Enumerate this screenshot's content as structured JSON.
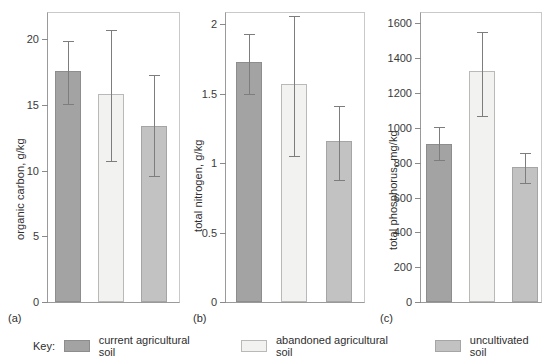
{
  "chart_data": [
    {
      "type": "bar",
      "panel": "(a)",
      "title": "",
      "xlabel": "",
      "ylabel": "organic carbon, g/kg",
      "ylim": [
        0,
        22
      ],
      "yticks": [
        0,
        5,
        10,
        15,
        20
      ],
      "ytick_labels": [
        "0",
        "5",
        "10",
        "15",
        "20"
      ],
      "grid": false,
      "categories": [
        "current agricultural soil",
        "abandoned agricultural soil",
        "uncultivated soil"
      ],
      "values": [
        17.6,
        15.8,
        13.4
      ],
      "err_upper": [
        19.9,
        20.7,
        17.3
      ],
      "err_lower": [
        15.1,
        10.7,
        9.6
      ]
    },
    {
      "type": "bar",
      "panel": "(b)",
      "title": "",
      "xlabel": "",
      "ylabel": "total nitrogen, g/kg",
      "ylim": [
        0,
        2.08
      ],
      "yticks": [
        0,
        0.5,
        1,
        1.5,
        2
      ],
      "ytick_labels": [
        "0",
        "0.5",
        "1",
        "1.5",
        "2"
      ],
      "grid": false,
      "categories": [
        "current agricultural soil",
        "abandoned agricultural soil",
        "uncultivated soil"
      ],
      "values": [
        1.73,
        1.57,
        1.16
      ],
      "err_upper": [
        1.93,
        2.06,
        1.41
      ],
      "err_lower": [
        1.5,
        1.05,
        0.88
      ]
    },
    {
      "type": "bar",
      "panel": "(c)",
      "title": "",
      "xlabel": "",
      "ylabel": "total phosphorus, mg/kg",
      "ylim": [
        0,
        1660
      ],
      "yticks": [
        0,
        200,
        400,
        600,
        800,
        1000,
        1200,
        1400,
        1600
      ],
      "ytick_labels": [
        "0",
        "200",
        "400",
        "600",
        "800",
        "1000",
        "1200",
        "1400",
        "1600"
      ],
      "grid": false,
      "categories": [
        "current agricultural soil",
        "abandoned agricultural soil",
        "uncultivated soil"
      ],
      "values": [
        910,
        1325,
        775
      ],
      "err_upper": [
        1005,
        1550,
        855
      ],
      "err_lower": [
        815,
        1070,
        685
      ]
    }
  ],
  "legend": {
    "key_label": "Key:",
    "position": "bottom",
    "items": [
      {
        "label": "current agricultural soil",
        "color": "#a3a3a3"
      },
      {
        "label": "abandoned agricultural soil",
        "color": "#f2f2f0"
      },
      {
        "label": "uncultivated soil",
        "color": "#c2c2c2"
      }
    ]
  }
}
